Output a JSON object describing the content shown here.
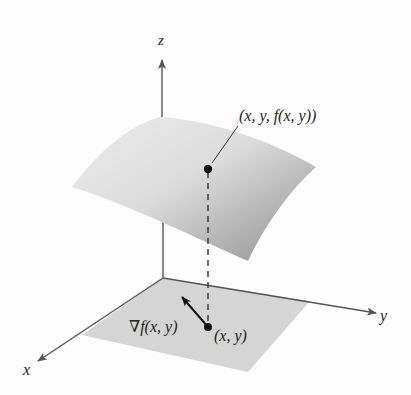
{
  "figure": {
    "axes": {
      "x_label": "x",
      "y_label": "y",
      "z_label": "z"
    },
    "labels": {
      "surface_point": "(x, y, f(x, y))",
      "plane_point": "(x, y)",
      "gradient": "∇f(x, y)"
    },
    "colors": {
      "axis": "#555555",
      "surface_light": "#e6e6e6",
      "surface_dark": "#9a9a9a",
      "plane": "#d4d4d4",
      "point": "#111111",
      "text": "#222222"
    }
  }
}
